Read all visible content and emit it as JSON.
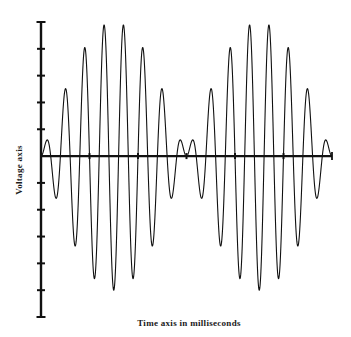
{
  "chart_data": {
    "type": "line",
    "title": "",
    "xlabel": "Time axis in milliseconds",
    "ylabel": "Voltage axis",
    "x_tick_labels": [],
    "y_tick_labels": [],
    "xlim": [
      0,
      6
    ],
    "ylim": [
      -6,
      5
    ],
    "x_ticks": [
      0,
      1,
      2,
      3,
      4,
      5,
      6
    ],
    "y_ticks": [
      -6,
      -5,
      -4,
      -3,
      -2,
      -1,
      0,
      1,
      2,
      3,
      4,
      5
    ],
    "grid": false,
    "legend": "none",
    "series": [
      {
        "name": "DSB-SC modulated signal",
        "description": "carrier multiplied by a sinusoidal envelope; envelope zero crossings at x = 0, 3, 6 with carrier phase reversal",
        "envelope_amplitude": 5,
        "envelope_zero_crossings": [
          0,
          3,
          6
        ],
        "carrier_cycles_per_x_unit": 2.5,
        "extrema": [
          {
            "x": 0.1,
            "y": 0.52
          },
          {
            "x": 0.31,
            "y": -1.53
          },
          {
            "x": 0.52,
            "y": 2.5
          },
          {
            "x": 0.7,
            "y": -3.36
          },
          {
            "x": 0.91,
            "y": 4.03
          },
          {
            "x": 1.11,
            "y": -4.55
          },
          {
            "x": 1.32,
            "y": 4.85
          },
          {
            "x": 1.51,
            "y": -5.0
          },
          {
            "x": 1.73,
            "y": 4.85
          },
          {
            "x": 1.92,
            "y": -4.55
          },
          {
            "x": 2.12,
            "y": 4.03
          },
          {
            "x": 2.31,
            "y": -3.36
          },
          {
            "x": 2.52,
            "y": 2.5
          },
          {
            "x": 2.7,
            "y": -1.53
          },
          {
            "x": 2.89,
            "y": 0.52
          },
          {
            "x": 3.11,
            "y": 0.52
          },
          {
            "x": 3.32,
            "y": -1.53
          },
          {
            "x": 3.53,
            "y": 2.5
          },
          {
            "x": 3.71,
            "y": -3.36
          },
          {
            "x": 3.92,
            "y": 4.03
          },
          {
            "x": 4.1,
            "y": -4.55
          },
          {
            "x": 4.33,
            "y": 4.85
          },
          {
            "x": 4.52,
            "y": -5.0
          },
          {
            "x": 4.74,
            "y": 4.85
          },
          {
            "x": 4.9,
            "y": -4.55
          },
          {
            "x": 5.13,
            "y": 4.03
          },
          {
            "x": 5.32,
            "y": -3.36
          },
          {
            "x": 5.51,
            "y": 2.5
          },
          {
            "x": 5.71,
            "y": -1.53
          },
          {
            "x": 5.92,
            "y": 0.52
          }
        ]
      }
    ]
  },
  "colors": {
    "line": "#111111",
    "axis": "#111111",
    "text": "#1a1a1a",
    "background": "#ffffff"
  }
}
